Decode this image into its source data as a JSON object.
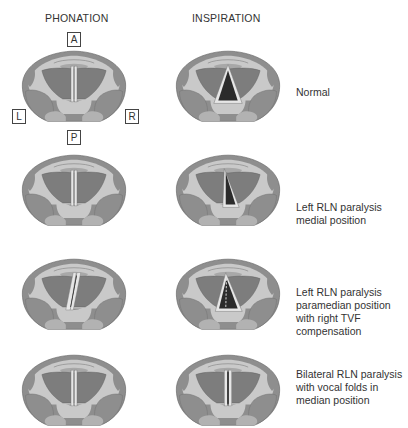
{
  "headers": {
    "phonation": "PHONATION",
    "inspiration": "INSPIRATION"
  },
  "orientation": {
    "anterior": "A",
    "posterior": "P",
    "left": "L",
    "right": "R"
  },
  "rows": [
    {
      "caption": "Normal"
    },
    {
      "caption": "Left RLN paralysis\nmedial position"
    },
    {
      "caption": "Left RLN paralysis\nparamedian position\nwith right TVF\ncompensation"
    },
    {
      "caption": "Bilateral RLN paralysis\nwith vocal folds in\nmedian position"
    }
  ],
  "colors": {
    "outer": "#8e8e8e",
    "ring": "#c9c9c9",
    "muscle": "#7d7d7d",
    "fold": "#e6e6e6",
    "glottis": "#2b2b2b",
    "outline": "#5e5e5e"
  }
}
